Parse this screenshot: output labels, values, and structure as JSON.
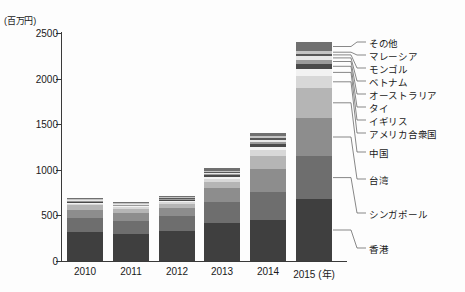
{
  "axis": {
    "unit_label": "(百万円)",
    "y_ticks": [
      {
        "value": 0,
        "label": "0"
      },
      {
        "value": 500,
        "label": "500"
      },
      {
        "value": 1000,
        "label": "1000"
      },
      {
        "value": 1500,
        "label": "1500"
      },
      {
        "value": 2000,
        "label": "2000"
      },
      {
        "value": 2500,
        "label": "2500"
      }
    ],
    "x_labels": [
      "2010",
      "2011",
      "2012",
      "2013",
      "2014",
      "2015"
    ],
    "x_unit_suffix": "(年)"
  },
  "legend_labels": [
    "その他",
    "マレーシア",
    "モンゴル",
    "ベトナム",
    "オーストラリア",
    "タイ",
    "イギリス",
    "アメリカ合衆国",
    "中国",
    "台湾",
    "シンガポール",
    "香港"
  ],
  "chart_data": {
    "type": "bar",
    "stacked": true,
    "title": "",
    "xlabel": "(年)",
    "ylabel": "(百万円)",
    "ylim": [
      0,
      2500
    ],
    "grid": false,
    "legend_position": "right-callout",
    "categories": [
      "2010",
      "2011",
      "2012",
      "2013",
      "2014",
      "2015"
    ],
    "totals": [
      690,
      645,
      710,
      1020,
      1405,
      2300
    ],
    "series": [
      {
        "name": "香港",
        "color": "#3f3f3f",
        "values": [
          320,
          300,
          330,
          420,
          455,
          680
        ]
      },
      {
        "name": "シンガポール",
        "color": "#6e6e6e",
        "values": [
          150,
          140,
          160,
          230,
          300,
          470
        ]
      },
      {
        "name": "台湾",
        "color": "#8d8d8d",
        "values": [
          95,
          90,
          95,
          150,
          250,
          420
        ]
      },
      {
        "name": "中国",
        "color": "#b5b5b5",
        "values": [
          45,
          40,
          40,
          65,
          150,
          330
        ]
      },
      {
        "name": "アメリカ合衆国",
        "color": "#d8d8d8",
        "values": [
          20,
          18,
          20,
          35,
          65,
          130
        ]
      },
      {
        "name": "イギリス",
        "color": "#f2f2f2",
        "values": [
          12,
          10,
          12,
          22,
          35,
          75
        ]
      },
      {
        "name": "タイ",
        "color": "#4a4a4a",
        "values": [
          10,
          9,
          10,
          18,
          30,
          60
        ]
      },
      {
        "name": "オーストラリア",
        "color": "#9a9a9a",
        "values": [
          8,
          8,
          9,
          15,
          25,
          45
        ]
      },
      {
        "name": "ベトナム",
        "color": "#e8e8e8",
        "values": [
          6,
          6,
          7,
          12,
          20,
          35
        ]
      },
      {
        "name": "モンゴル",
        "color": "#585858",
        "values": [
          6,
          6,
          7,
          12,
          18,
          30
        ]
      },
      {
        "name": "マレーシア",
        "color": "#c4c4c4",
        "values": [
          6,
          6,
          8,
          13,
          19,
          30
        ]
      },
      {
        "name": "その他",
        "color": "#707070",
        "values": [
          12,
          12,
          12,
          28,
          38,
          95
        ]
      }
    ]
  }
}
